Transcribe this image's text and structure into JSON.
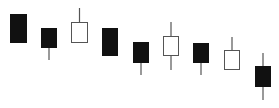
{
  "chart_data": {
    "type": "candlestick",
    "title": "",
    "xlabel": "",
    "ylabel": "",
    "grid": false,
    "legend": null,
    "colors": {
      "bearish": "#111111",
      "bullish": "#ffffff",
      "outline": "#555555",
      "wick": "#555555"
    },
    "candles": [
      {
        "index": 1,
        "x": 10,
        "width": 17,
        "body_top": 14,
        "body_bottom": 43,
        "high": 14,
        "low": 43,
        "direction": "bearish"
      },
      {
        "index": 2,
        "x": 41,
        "width": 16,
        "body_top": 28,
        "body_bottom": 48,
        "high": 28,
        "low": 60,
        "direction": "bearish"
      },
      {
        "index": 3,
        "x": 71,
        "width": 17,
        "body_top": 22,
        "body_bottom": 43,
        "high": 8,
        "low": 43,
        "direction": "bullish"
      },
      {
        "index": 4,
        "x": 102,
        "width": 16,
        "body_top": 28,
        "body_bottom": 56,
        "high": 28,
        "low": 56,
        "direction": "bearish"
      },
      {
        "index": 5,
        "x": 133,
        "width": 16,
        "body_top": 42,
        "body_bottom": 63,
        "high": 42,
        "low": 75,
        "direction": "bearish"
      },
      {
        "index": 6,
        "x": 163,
        "width": 16,
        "body_top": 36,
        "body_bottom": 56,
        "high": 22,
        "low": 70,
        "direction": "bullish"
      },
      {
        "index": 7,
        "x": 193,
        "width": 16,
        "body_top": 43,
        "body_bottom": 63,
        "high": 43,
        "low": 75,
        "direction": "bearish"
      },
      {
        "index": 8,
        "x": 224,
        "width": 16,
        "body_top": 50,
        "body_bottom": 70,
        "high": 37,
        "low": 70,
        "direction": "bullish"
      },
      {
        "index": 9,
        "x": 255,
        "width": 16,
        "body_top": 66,
        "body_bottom": 87,
        "high": 53,
        "low": 100,
        "direction": "bearish"
      }
    ],
    "note": "Values are pixel y-coordinates (smaller = higher price); no axes or tick labels are shown."
  }
}
